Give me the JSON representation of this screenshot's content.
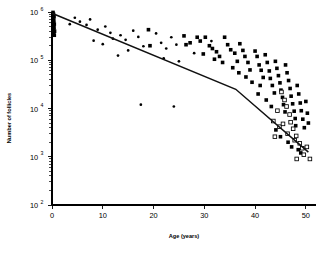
{
  "chart_data": {
    "type": "scatter",
    "title": "",
    "xlabel": "Age (years)",
    "ylabel": "Number of follicles",
    "xlim": [
      0,
      52
    ],
    "ylim": [
      100,
      1000000
    ],
    "yscale": "log10",
    "grid": false,
    "legend": false,
    "xticks": [
      0,
      10,
      20,
      30,
      40,
      50
    ],
    "xticklabels": [
      "0",
      "10",
      "20",
      "30",
      "40",
      "50"
    ],
    "yticks": [
      100,
      1000,
      10000,
      100000,
      1000000
    ],
    "yticklabels": [
      "10",
      "10",
      "10",
      "10",
      "10"
    ],
    "ytickexponents": [
      "2",
      "3",
      "4",
      "5",
      "6"
    ],
    "y_minor_ticks_per_decade": 9,
    "series": [
      {
        "name": "filled-squares",
        "marker": "filled-square",
        "points": [
          [
            0.2,
            980000
          ],
          [
            0.3,
            900000
          ],
          [
            0.25,
            840000
          ],
          [
            0.4,
            790000
          ],
          [
            0.2,
            720000
          ],
          [
            0.35,
            660000
          ],
          [
            0.3,
            610000
          ],
          [
            0.45,
            560000
          ],
          [
            0.25,
            520000
          ],
          [
            0.4,
            470000
          ],
          [
            0.3,
            430000
          ],
          [
            0.5,
            400000
          ],
          [
            0.35,
            360000
          ],
          [
            0.45,
            330000
          ],
          [
            19.0,
            430000
          ],
          [
            19.3,
            200000
          ],
          [
            26.0,
            320000
          ],
          [
            26.4,
            210000
          ],
          [
            27.2,
            230000
          ],
          [
            28.6,
            300000
          ],
          [
            29.2,
            250000
          ],
          [
            29.8,
            135000
          ],
          [
            30.2,
            300000
          ],
          [
            31.0,
            200000
          ],
          [
            31.6,
            175000
          ],
          [
            32.4,
            150000
          ],
          [
            33.0,
            120000
          ],
          [
            34.0,
            300000
          ],
          [
            34.6,
            210000
          ],
          [
            35.2,
            165000
          ],
          [
            36.0,
            140000
          ],
          [
            36.5,
            95000
          ],
          [
            37.0,
            220000
          ],
          [
            37.6,
            160000
          ],
          [
            38.0,
            120000
          ],
          [
            38.6,
            90000
          ],
          [
            39.0,
            63000
          ],
          [
            40.0,
            155000
          ],
          [
            40.4,
            120000
          ],
          [
            40.8,
            80000
          ],
          [
            41.2,
            62000
          ],
          [
            41.6,
            44000
          ],
          [
            41.0,
            30000
          ],
          [
            42.0,
            130000
          ],
          [
            42.4,
            90000
          ],
          [
            42.8,
            60000
          ],
          [
            43.0,
            42000
          ],
          [
            43.4,
            30000
          ],
          [
            43.8,
            21000
          ],
          [
            44.0,
            95000
          ],
          [
            44.3,
            68000
          ],
          [
            44.6,
            48000
          ],
          [
            44.9,
            34000
          ],
          [
            45.1,
            24000
          ],
          [
            45.4,
            17000
          ],
          [
            45.6,
            12000
          ],
          [
            45.9,
            8500
          ],
          [
            46.0,
            80000
          ],
          [
            46.3,
            55000
          ],
          [
            46.6,
            38000
          ],
          [
            46.9,
            26000
          ],
          [
            47.1,
            18000
          ],
          [
            47.4,
            12500
          ],
          [
            47.7,
            8800
          ],
          [
            47.9,
            6200
          ],
          [
            48.0,
            4400
          ],
          [
            48.3,
            30000
          ],
          [
            48.6,
            20000
          ],
          [
            48.9,
            13000
          ],
          [
            49.1,
            9000
          ],
          [
            49.4,
            6000
          ],
          [
            49.7,
            4000
          ],
          [
            50.0,
            14000
          ],
          [
            50.3,
            8000
          ],
          [
            50.5,
            5000
          ],
          [
            42.2,
            15000
          ],
          [
            43.2,
            11000
          ],
          [
            40.6,
            20000
          ],
          [
            39.4,
            35000
          ],
          [
            38.2,
            45000
          ],
          [
            36.8,
            55000
          ],
          [
            35.6,
            70000
          ],
          [
            33.6,
            90000
          ],
          [
            32.0,
            105000
          ],
          [
            44.1,
            3600
          ],
          [
            45.0,
            2600
          ],
          [
            46.5,
            2000
          ],
          [
            47.2,
            1600
          ],
          [
            48.5,
            1400
          ],
          [
            49.0,
            1200
          ]
        ]
      },
      {
        "name": "open-squares",
        "marker": "open-square",
        "points": [
          [
            45.2,
            22000
          ],
          [
            45.8,
            15000
          ],
          [
            46.2,
            11000
          ],
          [
            46.8,
            7500
          ],
          [
            47.0,
            5200
          ],
          [
            47.5,
            3800
          ],
          [
            48.1,
            2700
          ],
          [
            48.8,
            1900
          ],
          [
            49.3,
            1500
          ],
          [
            44.4,
            9000
          ],
          [
            43.6,
            5500
          ],
          [
            44.8,
            4200
          ],
          [
            46.4,
            3000
          ],
          [
            47.8,
            2200
          ],
          [
            49.6,
            1100
          ],
          [
            50.2,
            1600
          ],
          [
            50.8,
            900
          ],
          [
            48.2,
            900
          ],
          [
            45.5,
            4800
          ],
          [
            43.9,
            2600
          ]
        ]
      },
      {
        "name": "small-dots",
        "marker": "dot",
        "points": [
          [
            5.5,
            630000
          ],
          [
            6.8,
            540000
          ],
          [
            7.5,
            700000
          ],
          [
            9.0,
            430000
          ],
          [
            10.5,
            500000
          ],
          [
            11.5,
            370000
          ],
          [
            12.0,
            280000
          ],
          [
            13.5,
            330000
          ],
          [
            14.5,
            265000
          ],
          [
            16.0,
            410000
          ],
          [
            17.0,
            305000
          ],
          [
            18.0,
            195000
          ],
          [
            20.5,
            360000
          ],
          [
            21.5,
            230000
          ],
          [
            22.5,
            175000
          ],
          [
            23.5,
            300000
          ],
          [
            24.5,
            210000
          ],
          [
            25.0,
            95000
          ],
          [
            8.2,
            255000
          ],
          [
            10.0,
            215000
          ],
          [
            15.0,
            160000
          ],
          [
            13.0,
            125000
          ],
          [
            22.0,
            110000
          ],
          [
            28.0,
            140000
          ],
          [
            17.5,
            12000
          ],
          [
            24.0,
            11000
          ],
          [
            31.4,
            250000
          ],
          [
            4.5,
            760000
          ],
          [
            3.5,
            560000
          ]
        ]
      }
    ],
    "fit_line": {
      "name": "bilinear-regression",
      "description": "biphasic log-linear fit with breakpoint",
      "vertices": [
        [
          0.0,
          940000
        ],
        [
          36.2,
          25000
        ],
        [
          50.5,
          1250
        ]
      ]
    }
  }
}
